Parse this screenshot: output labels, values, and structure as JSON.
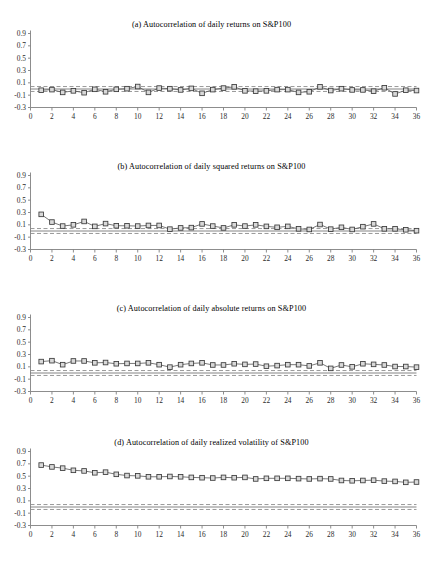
{
  "figure": {
    "background": "#ffffff",
    "marker_fill": "#d9d9d9",
    "marker_stroke": "#3a3a3a",
    "line_color": "#555555",
    "axis_color": "#808080",
    "band_color": "#8c8c8c",
    "zero_line_color": "#666666"
  },
  "axes": {
    "ytick_labels": [
      "0.9",
      "0.7",
      "0.5",
      "0.3",
      "0.1",
      "-0.1",
      "-0.3"
    ],
    "ytick_values": [
      0.9,
      0.7,
      0.5,
      0.3,
      0.1,
      -0.1,
      -0.3
    ],
    "ylim": [
      -0.3,
      0.9
    ],
    "xtick_labels": [
      "0",
      "2",
      "4",
      "6",
      "8",
      "10",
      "12",
      "14",
      "16",
      "18",
      "20",
      "22",
      "24",
      "26",
      "28",
      "30",
      "32",
      "34",
      "36"
    ],
    "xtick_values": [
      0,
      2,
      4,
      6,
      8,
      10,
      12,
      14,
      16,
      18,
      20,
      22,
      24,
      26,
      28,
      30,
      32,
      34,
      36
    ],
    "xlim": [
      0,
      36
    ],
    "xlabel": "",
    "ylabel": "",
    "grid": false,
    "legend": "none"
  },
  "chart_data": [
    {
      "type": "line",
      "panel": "a",
      "title": "(a) Autocorrelation of daily returns on S&P100",
      "xlabel": "",
      "ylabel": "",
      "xlim": [
        0,
        36
      ],
      "ylim": [
        -0.3,
        0.9
      ],
      "grid": false,
      "legend": "none",
      "marker": "square",
      "x": [
        1,
        2,
        3,
        4,
        5,
        6,
        7,
        8,
        9,
        10,
        11,
        12,
        13,
        14,
        15,
        16,
        17,
        18,
        19,
        20,
        21,
        22,
        23,
        24,
        25,
        26,
        27,
        28,
        29,
        30,
        31,
        32,
        33,
        34,
        35,
        36
      ],
      "values": [
        -0.02,
        -0.01,
        -0.055,
        -0.03,
        -0.06,
        -0.005,
        -0.045,
        -0.005,
        0.005,
        0.04,
        -0.055,
        0.015,
        0.005,
        -0.015,
        0.01,
        -0.07,
        -0.01,
        0.015,
        0.035,
        -0.03,
        -0.035,
        -0.03,
        -0.01,
        -0.01,
        -0.055,
        -0.045,
        0.035,
        -0.025,
        0.005,
        -0.015,
        -0.015,
        -0.035,
        0.02,
        -0.08,
        -0.02,
        -0.025
      ],
      "confidence_band": [
        -0.04,
        0.04
      ],
      "zero_line": 0.0
    },
    {
      "type": "line",
      "panel": "b",
      "title": "(b) Autocorrelation of daily squared returns on S&P100",
      "xlabel": "",
      "ylabel": "",
      "xlim": [
        0,
        36
      ],
      "ylim": [
        -0.3,
        0.9
      ],
      "grid": false,
      "legend": "none",
      "marker": "square",
      "x": [
        1,
        2,
        3,
        4,
        5,
        6,
        7,
        8,
        9,
        10,
        11,
        12,
        13,
        14,
        15,
        16,
        17,
        18,
        19,
        20,
        21,
        22,
        23,
        24,
        25,
        26,
        27,
        28,
        29,
        30,
        31,
        32,
        33,
        34,
        35,
        36
      ],
      "values": [
        0.27,
        0.145,
        0.08,
        0.1,
        0.155,
        0.075,
        0.12,
        0.085,
        0.085,
        0.08,
        0.09,
        0.09,
        0.03,
        0.05,
        0.055,
        0.115,
        0.08,
        0.05,
        0.1,
        0.08,
        0.1,
        0.075,
        0.06,
        0.075,
        0.035,
        0.025,
        0.105,
        0.03,
        0.06,
        0.025,
        0.07,
        0.115,
        0.035,
        0.035,
        0.02,
        0.005
      ],
      "confidence_band": [
        -0.04,
        0.04
      ],
      "zero_line": 0.0
    },
    {
      "type": "line",
      "panel": "c",
      "title": "(c) Autocorrelation of daily absolute returns on S&P100",
      "xlabel": "",
      "ylabel": "",
      "xlim": [
        0,
        36
      ],
      "ylim": [
        -0.3,
        0.9
      ],
      "grid": false,
      "legend": "none",
      "marker": "square",
      "x": [
        1,
        2,
        3,
        4,
        5,
        6,
        7,
        8,
        9,
        10,
        11,
        12,
        13,
        14,
        15,
        16,
        17,
        18,
        19,
        20,
        21,
        22,
        23,
        24,
        25,
        26,
        27,
        28,
        29,
        30,
        31,
        32,
        33,
        34,
        35,
        36
      ],
      "values": [
        0.185,
        0.2,
        0.135,
        0.195,
        0.195,
        0.165,
        0.17,
        0.15,
        0.155,
        0.155,
        0.165,
        0.135,
        0.095,
        0.135,
        0.155,
        0.165,
        0.13,
        0.13,
        0.15,
        0.14,
        0.145,
        0.11,
        0.12,
        0.135,
        0.135,
        0.115,
        0.165,
        0.075,
        0.13,
        0.1,
        0.15,
        0.14,
        0.13,
        0.105,
        0.105,
        0.095
      ],
      "confidence_band": [
        -0.04,
        0.04
      ],
      "zero_line": 0.0
    },
    {
      "type": "line",
      "panel": "d",
      "title": "(d) Autocorrelation of daily realized volatility of S&P100",
      "xlabel": "",
      "ylabel": "",
      "xlim": [
        0,
        36
      ],
      "ylim": [
        -0.3,
        0.9
      ],
      "grid": false,
      "legend": "none",
      "marker": "square",
      "x": [
        1,
        2,
        3,
        4,
        5,
        6,
        7,
        8,
        9,
        10,
        11,
        12,
        13,
        14,
        15,
        16,
        17,
        18,
        19,
        20,
        21,
        22,
        23,
        24,
        25,
        26,
        27,
        28,
        29,
        30,
        31,
        32,
        33,
        34,
        35,
        36
      ],
      "values": [
        0.68,
        0.65,
        0.63,
        0.595,
        0.585,
        0.555,
        0.565,
        0.53,
        0.51,
        0.505,
        0.49,
        0.49,
        0.495,
        0.49,
        0.48,
        0.475,
        0.47,
        0.48,
        0.475,
        0.48,
        0.455,
        0.465,
        0.465,
        0.465,
        0.46,
        0.455,
        0.46,
        0.455,
        0.43,
        0.425,
        0.43,
        0.435,
        0.42,
        0.415,
        0.4,
        0.405
      ],
      "confidence_band": [
        -0.04,
        0.04
      ],
      "zero_line": 0.0
    }
  ]
}
